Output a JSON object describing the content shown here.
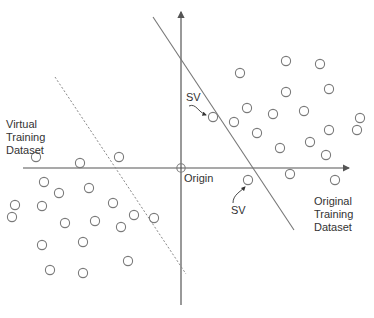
{
  "diagram": {
    "title": "",
    "labels": {
      "virtual": [
        "Virtual",
        "Training",
        "Dataset"
      ],
      "original": [
        "Original",
        "Training",
        "Dataset"
      ],
      "origin": "Origin",
      "sv_upper": "SV",
      "sv_lower": "SV"
    },
    "axes": {
      "origin": [
        181,
        168
      ],
      "x_axis": {
        "from": [
          23,
          168
        ],
        "to": [
          349,
          168
        ]
      },
      "y_axis": {
        "from": [
          181,
          305
        ],
        "to": [
          181,
          12
        ]
      }
    },
    "lines": {
      "original_hyperplane": {
        "from": [
          153,
          17
        ],
        "to": [
          294,
          230
        ],
        "style": "solid"
      },
      "virtual_hyperplane": {
        "from": [
          55,
          77
        ],
        "to": [
          186,
          274
        ],
        "style": "dashed"
      }
    },
    "points": {
      "original": [
        [
          240,
          73
        ],
        [
          286,
          61
        ],
        [
          320,
          64
        ],
        [
          286,
          92
        ],
        [
          329,
          89
        ],
        [
          247,
          108
        ],
        [
          273,
          114
        ],
        [
          304,
          111
        ],
        [
          360,
          118
        ],
        [
          234,
          122
        ],
        [
          257,
          133
        ],
        [
          329,
          130
        ],
        [
          357,
          130
        ],
        [
          280,
          148
        ],
        [
          310,
          142
        ],
        [
          326,
          155
        ],
        [
          290,
          174
        ],
        [
          335,
          180
        ]
      ],
      "virtual": [
        [
          36,
          157
        ],
        [
          80,
          163
        ],
        [
          119,
          157
        ],
        [
          44,
          182
        ],
        [
          59,
          193
        ],
        [
          89,
          188
        ],
        [
          42,
          206
        ],
        [
          113,
          203
        ],
        [
          15,
          205
        ],
        [
          12,
          217
        ],
        [
          65,
          223
        ],
        [
          95,
          221
        ],
        [
          121,
          227
        ],
        [
          134,
          215
        ],
        [
          154,
          218
        ],
        [
          42,
          245
        ],
        [
          83,
          242
        ],
        [
          128,
          261
        ],
        [
          50,
          270
        ],
        [
          83,
          273
        ]
      ],
      "support_vectors": [
        [
          213,
          117
        ],
        [
          248,
          180
        ]
      ]
    },
    "colors": {
      "stroke": "#7a7a7a",
      "axis": "#555555",
      "text": "#333333"
    }
  }
}
